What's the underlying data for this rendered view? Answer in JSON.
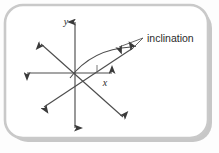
{
  "figure": {
    "kind": "line-diagram",
    "title": "inclination",
    "background_color": "#fdfdfd",
    "frame": {
      "shape": "rounded-rectangle",
      "border_color": "#c9c9c9",
      "shadow_color": "#9a9a9a",
      "fill_color": "#ffffff",
      "corner_radius": 18
    },
    "ink_color": "#4d4d4d",
    "arrow_color": "#3a3a3a"
  },
  "labels": {
    "y_axis": "y",
    "x_axis": "x",
    "callout": "inclination"
  },
  "diagram_data": {
    "type": "vector-diagram",
    "origin": {
      "x": 75,
      "y": 73
    },
    "axes": [
      {
        "name": "y-axis",
        "orientation": "vertical",
        "from": {
          "x": 75,
          "y": 128
        },
        "to": {
          "x": 75,
          "y": 22
        },
        "arrow_both_ends": true,
        "label": "y",
        "label_position": {
          "x": 66,
          "y": 25
        }
      },
      {
        "name": "x-axis",
        "orientation": "horizontal",
        "from": {
          "x": 27,
          "y": 73
        },
        "to": {
          "x": 112,
          "y": 73
        },
        "arrow_both_ends": true,
        "label": "x",
        "label_position": {
          "x": 105,
          "y": 85
        }
      }
    ],
    "diagonals": [
      {
        "name": "upper-left-to-lower-right",
        "from": {
          "x": 41,
          "y": 44
        },
        "to": {
          "x": 123,
          "y": 117
        },
        "arrow_both_ends": true
      },
      {
        "name": "lower-left-to-upper-right-inclined",
        "from": {
          "x": 44,
          "y": 107
        },
        "to": {
          "x": 133,
          "y": 48
        },
        "arrow_both_ends": true
      }
    ],
    "angle_arc": {
      "name": "inclination-arc",
      "start": {
        "x": 70,
        "y": 78
      },
      "end": {
        "x": 131,
        "y": 47
      },
      "control": {
        "x": 92,
        "y": 49
      },
      "measures": "inclination angle"
    },
    "angle_tick": {
      "name": "angle-tick-mark",
      "from": {
        "x": 97,
        "y": 65
      },
      "to": {
        "x": 97,
        "y": 73
      }
    },
    "callout": {
      "text": "inclination",
      "text_position": {
        "x": 145,
        "y": 41
      },
      "arrow_tip": {
        "x": 119,
        "y": 47
      },
      "leader_lines": [
        {
          "from": {
            "x": 143,
            "y": 38
          },
          "to": {
            "x": 119,
            "y": 47
          }
        },
        {
          "from": {
            "x": 143,
            "y": 38
          },
          "to": {
            "x": 131,
            "y": 50
          }
        }
      ]
    }
  }
}
